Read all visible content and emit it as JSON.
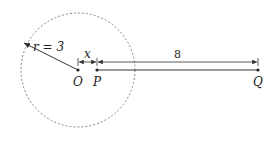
{
  "diagram": {
    "circle": {
      "cx": 78,
      "cy": 70,
      "r": 57,
      "style": "dashed"
    },
    "points": [
      {
        "name": "O",
        "x": 78,
        "y": 70
      },
      {
        "name": "P",
        "x": 97,
        "y": 70
      },
      {
        "name": "Q",
        "x": 258,
        "y": 70
      }
    ],
    "labels": {
      "O": "O",
      "P": "P",
      "Q": "Q",
      "radius": "r = 3",
      "x_dimension": "x",
      "pq_dimension": "8"
    },
    "colors": {
      "stroke": "#333333",
      "dash": "#666666"
    }
  }
}
